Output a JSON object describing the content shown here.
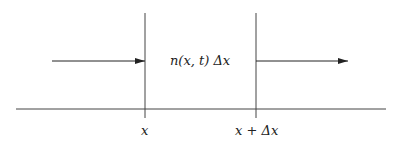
{
  "diagram": {
    "center_label": "n(x, t) Δx",
    "left_boundary_label": "x",
    "right_boundary_label": "x + Δx",
    "colors": {
      "line": "#333333",
      "background": "#ffffff"
    }
  }
}
